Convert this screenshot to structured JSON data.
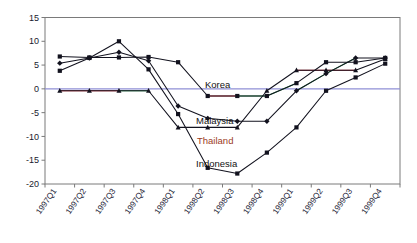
{
  "chart_data": {
    "type": "line",
    "title": "",
    "xlabel": "",
    "ylabel": "",
    "ylim": [
      -20,
      15
    ],
    "ytick_values": [
      15,
      10,
      5,
      0,
      -5,
      -10,
      -15,
      -20
    ],
    "ytick_labels": [
      "15",
      "10",
      "5",
      "0",
      "-5",
      "-10",
      "-15",
      "-20"
    ],
    "grid": false,
    "legend_position": "inline-annotations",
    "categories": [
      "1997Q1",
      "1997Q2",
      "1997Q3",
      "1997Q4",
      "1998Q1",
      "1998Q2",
      "1998Q3",
      "1998Q4",
      "1999Q1",
      "1999Q2",
      "1999Q3",
      "1999Q4"
    ],
    "series": [
      {
        "name": "Korea",
        "marker": "square",
        "color": "#12121e",
        "values": [
          6.8,
          6.6,
          6.6,
          6.7,
          5.6,
          -1.5,
          -1.5,
          -1.5,
          1.2,
          5.6,
          5.6,
          6.5
        ]
      },
      {
        "name": "Malaysia",
        "marker": "diamond",
        "color": "#12121e",
        "values": [
          5.4,
          6.5,
          7.7,
          5.9,
          -3.6,
          -6.2,
          -6.8,
          -6.8,
          -0.4,
          3.2,
          6.5,
          6.5
        ]
      },
      {
        "name": "Thailand",
        "marker": "triangle",
        "color": "#12121e",
        "values": [
          -0.4,
          -0.4,
          -0.4,
          -0.4,
          -8.1,
          -8.1,
          -8.1,
          -0.4,
          3.9,
          3.9,
          3.9,
          6.3
        ]
      },
      {
        "name": "Indonesia",
        "marker": "square",
        "color": "#12121e",
        "values": [
          3.8,
          6.5,
          10.0,
          4.1,
          -5.3,
          -16.6,
          -17.8,
          -13.4,
          -8.1,
          -0.4,
          2.4,
          5.3
        ]
      }
    ],
    "series_labels": [
      {
        "name": "Korea",
        "text": "Korea",
        "accent": false
      },
      {
        "name": "Malaysia",
        "text": "Malaysia",
        "accent": false
      },
      {
        "name": "Thailand",
        "text": "Thailand",
        "accent": true
      },
      {
        "name": "Indonesia",
        "text": "Indonesia",
        "accent": false
      }
    ],
    "colors": {
      "line": "#12121e",
      "zero_line": "#8f8fd6",
      "axis": "#7a7a7a",
      "accent_label": "#9c3b25",
      "tint_red": "#d4323c",
      "tint_green": "#2f9e54"
    }
  }
}
